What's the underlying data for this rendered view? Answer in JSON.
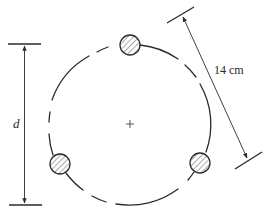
{
  "figure": {
    "type": "bolt-circle-diagram",
    "labels": {
      "diameter": "d",
      "bolt_spacing": "14 cm",
      "center_mark": "+"
    },
    "bolt_count": 3,
    "colors": {
      "stroke": "#2a2a2a",
      "hatch": "#555555",
      "background": "#ffffff"
    }
  }
}
